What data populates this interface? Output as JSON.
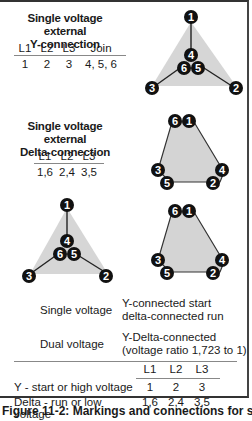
{
  "section_y": {
    "title_line1": "Single voltage external",
    "title_line2": "Y-connection",
    "headers": [
      "L1",
      "L2",
      "L3",
      "Join"
    ],
    "values": [
      "1",
      "2",
      "3",
      "4, 5, 6"
    ]
  },
  "section_delta": {
    "title_line1": "Single voltage external",
    "title_line2": "Delta-connection",
    "headers": [
      "L1",
      "L2",
      "L3"
    ],
    "values": [
      "1,6",
      "2,4",
      "3,5"
    ]
  },
  "diagrams": {
    "y_connection": {
      "terminals": [
        "1",
        "2",
        "3",
        "4",
        "5",
        "6"
      ]
    },
    "delta_connection": {
      "terminals": [
        "1",
        "2",
        "3",
        "4",
        "5",
        "6"
      ]
    },
    "y_terminal_color": "#111111",
    "triangle_fill": "#d4d4d4"
  },
  "summary": {
    "single_voltage_label": "Single voltage",
    "single_voltage_desc_line1": "Y-connected start",
    "single_voltage_desc_line2": "delta-connected run",
    "dual_voltage_label": "Dual voltage",
    "dual_voltage_desc_line1": "Y-Delta-connected",
    "dual_voltage_desc_line2": "(voltage ratio 1,723 to 1)"
  },
  "bottom_table": {
    "headers": [
      "L1",
      "L2",
      "L3"
    ],
    "rows": [
      {
        "label": "Y - start or high voltage",
        "values": [
          "1",
          "2",
          "3"
        ]
      },
      {
        "label": "Delta - run or low voltage",
        "values": [
          "1,6",
          "2,4",
          "3,5"
        ]
      }
    ]
  },
  "caption": "Figure 11-2: Markings and connections for single-"
}
